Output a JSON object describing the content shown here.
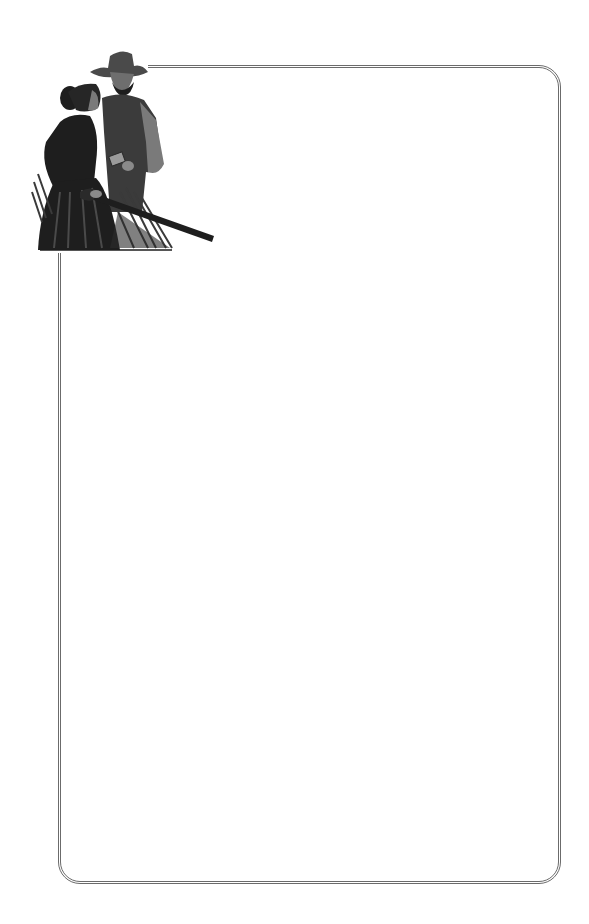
{
  "page": {
    "type": "decorative stationery",
    "background_color": "#ffffff",
    "frame": {
      "style": "double rounded border",
      "color": "#6b6b6b"
    },
    "illustration": {
      "icon": "western-couple-illustration",
      "description": "Cowboy in hat and vest standing behind a woman in a dark dress holding a rifle, tall grass at bottom",
      "colors": {
        "dark": "#1e1e1e",
        "mid": "#4a4a4a",
        "light": "#8a8a8a"
      }
    },
    "writing_area": {
      "content": ""
    }
  }
}
